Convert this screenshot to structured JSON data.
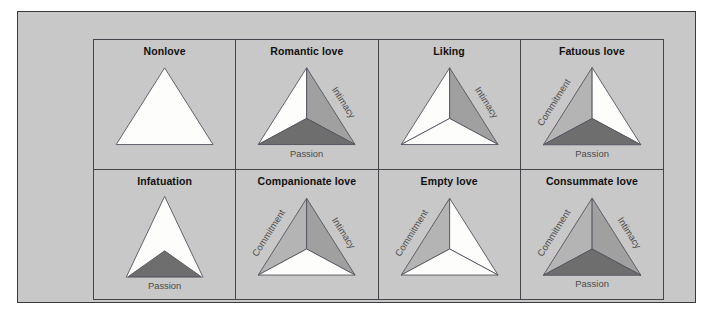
{
  "figure": {
    "colors": {
      "page_background": "#ffffff",
      "panel_background": "#c8c8c8",
      "panel_border": "#3a3a3a",
      "grid_border": "#44444a",
      "triangle_outline": "#555560",
      "empty_fill": "#fdfdfb",
      "intimacy_fill": "#a0a0a0",
      "commitment_fill": "#b4b4b4",
      "passion_fill": "#6e6e6e",
      "title_color": "#101010",
      "axis_label_color": "#4b4b4b"
    },
    "components": {
      "intimacy_label": "Intimacy",
      "passion_label": "Passion",
      "commitment_label": "Commitment"
    },
    "cells": [
      {
        "id": "nonlove",
        "title": "Nonlove",
        "shape": "wide",
        "divided": false,
        "intimacy": false,
        "passion": false,
        "commitment": false,
        "labels": []
      },
      {
        "id": "romantic-love",
        "title": "Romantic love",
        "shape": "wide",
        "divided": true,
        "intimacy": true,
        "passion": true,
        "commitment": false,
        "labels": [
          "Intimacy",
          "Passion"
        ]
      },
      {
        "id": "liking",
        "title": "Liking",
        "shape": "wide",
        "divided": true,
        "intimacy": true,
        "passion": false,
        "commitment": false,
        "labels": [
          "Intimacy"
        ]
      },
      {
        "id": "fatuous-love",
        "title": "Fatuous love",
        "shape": "wide",
        "divided": true,
        "intimacy": false,
        "passion": true,
        "commitment": true,
        "labels": [
          "Commitment",
          "Passion"
        ]
      },
      {
        "id": "infatuation",
        "title": "Infatuation",
        "shape": "narrow",
        "divided": false,
        "intimacy": false,
        "passion": true,
        "commitment": false,
        "labels": [
          "Passion"
        ]
      },
      {
        "id": "companionate-love",
        "title": "Companionate love",
        "shape": "wide",
        "divided": true,
        "intimacy": true,
        "passion": false,
        "commitment": true,
        "labels": [
          "Commitment",
          "Intimacy"
        ]
      },
      {
        "id": "empty-love",
        "title": "Empty love",
        "shape": "wide",
        "divided": true,
        "intimacy": false,
        "passion": false,
        "commitment": true,
        "labels": [
          "Commitment"
        ]
      },
      {
        "id": "consummate-love",
        "title": "Consummate love",
        "shape": "wide",
        "divided": true,
        "intimacy": true,
        "passion": true,
        "commitment": true,
        "labels": [
          "Commitment",
          "Intimacy",
          "Passion"
        ]
      }
    ]
  }
}
